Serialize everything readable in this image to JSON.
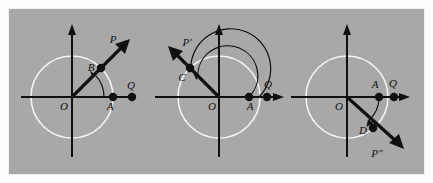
{
  "figure": {
    "background_color": "#a8a8a8",
    "page_color": "#fdfdfd",
    "circle_color": "#f4f4f4",
    "ink_color": "#101010",
    "panel_count": 3,
    "width": 433,
    "height": 183
  },
  "panels": [
    {
      "id": "panel-1",
      "caption": "",
      "origin_label": "O",
      "x_axis_point_label": "A",
      "extra_point_label": "Q",
      "circle_point_label": "B",
      "ray_tip_label": "P",
      "ray_direction_deg": 45,
      "arc_sweep": "counterclockwise",
      "arc_count": 1,
      "has_x_axis_arrow": false,
      "has_y_axis_arrow": true,
      "points": [
        {
          "name": "O",
          "label": "O",
          "x": 0,
          "y": 0,
          "drawn": false
        },
        {
          "name": "A",
          "label": "A",
          "x": 1,
          "y": 0,
          "drawn": true
        },
        {
          "name": "Q",
          "label": "Q",
          "x": 1.45,
          "y": 0,
          "drawn": true
        },
        {
          "name": "B",
          "label": "B",
          "x": 0.707,
          "y": 0.707,
          "drawn": true
        },
        {
          "name": "P",
          "label": "P",
          "x": 1.5,
          "y": 1.5,
          "drawn": false
        }
      ]
    },
    {
      "id": "panel-2",
      "caption": "",
      "origin_label": "O",
      "x_axis_point_label": "A",
      "extra_point_label": "Q",
      "circle_point_label": "C",
      "ray_tip_label": "P′",
      "ray_direction_deg": 135,
      "arc_sweep": "counterclockwise",
      "arc_count": 2,
      "has_x_axis_arrow": true,
      "has_y_axis_arrow": true,
      "points": [
        {
          "name": "O",
          "label": "O",
          "x": 0,
          "y": 0,
          "drawn": false
        },
        {
          "name": "A",
          "label": "A",
          "x": 1,
          "y": 0,
          "drawn": true
        },
        {
          "name": "Q",
          "label": "Q",
          "x": 1.42,
          "y": 0,
          "drawn": true
        },
        {
          "name": "C",
          "label": "C",
          "x": -0.707,
          "y": 0.707,
          "drawn": true
        },
        {
          "name": "P'",
          "label": "P′",
          "x": -1.5,
          "y": 1.5,
          "drawn": false
        }
      ]
    },
    {
      "id": "panel-3",
      "caption": "",
      "origin_label": "O",
      "x_axis_point_label": "A",
      "extra_point_label": "Q",
      "circle_point_label": "D",
      "ray_tip_label": "P″",
      "ray_direction_deg": -50,
      "arc_sweep": "clockwise",
      "arc_count": 1,
      "has_x_axis_arrow": true,
      "has_y_axis_arrow": true,
      "points": [
        {
          "name": "O",
          "label": "O",
          "x": 0,
          "y": 0,
          "drawn": false
        },
        {
          "name": "A",
          "label": "A",
          "x": 1,
          "y": 0,
          "drawn": true
        },
        {
          "name": "Q",
          "label": "Q",
          "x": 1.35,
          "y": 0,
          "drawn": true
        },
        {
          "name": "D",
          "label": "D",
          "x": 0.64,
          "y": -0.77,
          "drawn": true
        },
        {
          "name": "P''",
          "label": "P″",
          "x": 1.45,
          "y": -1.72,
          "drawn": false
        }
      ]
    }
  ]
}
